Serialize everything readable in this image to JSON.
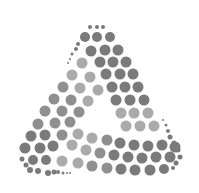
{
  "logo": {
    "shape": "triangle-of-dots",
    "colors": {
      "dark": "#7a7a7a",
      "mid": "#8f8f8f",
      "light": "#aaaaaa"
    },
    "dots": [
      [
        90,
        27,
        2,
        "d"
      ],
      [
        97,
        27,
        2,
        "d"
      ],
      [
        103,
        27,
        2,
        "d"
      ],
      [
        85,
        37,
        5,
        "d"
      ],
      [
        97,
        37,
        5,
        "d"
      ],
      [
        110,
        37,
        5,
        "d"
      ],
      [
        78,
        44,
        2,
        "d"
      ],
      [
        76,
        49,
        2,
        "d"
      ],
      [
        72,
        54,
        1.5,
        "d"
      ],
      [
        70,
        59,
        1,
        "d"
      ],
      [
        68,
        63,
        1,
        "d"
      ],
      [
        91,
        51,
        5.5,
        "d"
      ],
      [
        105,
        50,
        5.5,
        "d"
      ],
      [
        118,
        50,
        5.5,
        "d"
      ],
      [
        82,
        63,
        5.5,
        "l"
      ],
      [
        100,
        62,
        5.5,
        "d"
      ],
      [
        113,
        62,
        5.5,
        "d"
      ],
      [
        126,
        62,
        5.5,
        "d"
      ],
      [
        72,
        75,
        5.5,
        "l"
      ],
      [
        90,
        77,
        5.5,
        "l"
      ],
      [
        106,
        74,
        5.5,
        "d"
      ],
      [
        120,
        74,
        5.5,
        "d"
      ],
      [
        133,
        74,
        5.5,
        "d"
      ],
      [
        63,
        87,
        5.5,
        "m"
      ],
      [
        80,
        88,
        5.5,
        "l"
      ],
      [
        98,
        90,
        5.5,
        "l"
      ],
      [
        112,
        87,
        5.5,
        "d"
      ],
      [
        125,
        87,
        5.5,
        "d"
      ],
      [
        138,
        87,
        5.5,
        "d"
      ],
      [
        54,
        99,
        5.5,
        "m"
      ],
      [
        71,
        100,
        5.5,
        "m"
      ],
      [
        88,
        101,
        5.5,
        "l"
      ],
      [
        116,
        100,
        5.5,
        "d"
      ],
      [
        130,
        100,
        5.5,
        "d"
      ],
      [
        144,
        100,
        5.5,
        "d"
      ],
      [
        45,
        111,
        5.5,
        "m"
      ],
      [
        62,
        111,
        5.5,
        "m"
      ],
      [
        79,
        112,
        5.5,
        "m"
      ],
      [
        121,
        113,
        5.5,
        "l"
      ],
      [
        134,
        113,
        5.5,
        "l"
      ],
      [
        148,
        113,
        5.5,
        "l"
      ],
      [
        38,
        124,
        5.5,
        "m"
      ],
      [
        55,
        123,
        5.5,
        "m"
      ],
      [
        70,
        122,
        5.5,
        "m"
      ],
      [
        126,
        126,
        5.5,
        "l"
      ],
      [
        140,
        126,
        5.5,
        "l"
      ],
      [
        154,
        126,
        5.5,
        "l"
      ],
      [
        31,
        136,
        5.5,
        "d"
      ],
      [
        45,
        135,
        5.5,
        "d"
      ],
      [
        62,
        135,
        5.5,
        "m"
      ],
      [
        78,
        134,
        5.5,
        "l"
      ],
      [
        92,
        138,
        5.5,
        "l"
      ],
      [
        107,
        140,
        5.5,
        "m"
      ],
      [
        120,
        143,
        5.5,
        "d"
      ],
      [
        134,
        145,
        5.5,
        "d"
      ],
      [
        148,
        146,
        5.5,
        "d"
      ],
      [
        162,
        145,
        5.5,
        "d"
      ],
      [
        175,
        147,
        5.5,
        "d"
      ],
      [
        25,
        148,
        5.5,
        "d"
      ],
      [
        40,
        148,
        5.5,
        "d"
      ],
      [
        53,
        146,
        5.5,
        "d"
      ],
      [
        72,
        145,
        5.5,
        "l"
      ],
      [
        86,
        150,
        5.5,
        "l"
      ],
      [
        100,
        153,
        5.5,
        "m"
      ],
      [
        114,
        155,
        5.5,
        "d"
      ],
      [
        128,
        157,
        5.5,
        "d"
      ],
      [
        142,
        158,
        5.5,
        "d"
      ],
      [
        156,
        157,
        5.5,
        "d"
      ],
      [
        170,
        157,
        5.5,
        "d"
      ],
      [
        33,
        160,
        5,
        "d"
      ],
      [
        46,
        160,
        5,
        "d"
      ],
      [
        62,
        161,
        5.5,
        "l"
      ],
      [
        78,
        163,
        5.5,
        "l"
      ],
      [
        92,
        166,
        5.5,
        "m"
      ],
      [
        107,
        168,
        5.5,
        "m"
      ],
      [
        121,
        169,
        5.5,
        "d"
      ],
      [
        135,
        170,
        5.5,
        "d"
      ],
      [
        150,
        170,
        5.5,
        "d"
      ],
      [
        164,
        169,
        5,
        "d"
      ],
      [
        22,
        159,
        2.5,
        "d"
      ],
      [
        26,
        165,
        2.5,
        "d"
      ],
      [
        30,
        170,
        3,
        "d"
      ],
      [
        38,
        171,
        3,
        "d"
      ],
      [
        48,
        173,
        3,
        "d"
      ],
      [
        54,
        172,
        2.5,
        "d"
      ],
      [
        58,
        172,
        2,
        "d"
      ],
      [
        63,
        173,
        1.5,
        "d"
      ],
      [
        67,
        173,
        1,
        "d"
      ],
      [
        70,
        173,
        1,
        "d"
      ],
      [
        163,
        120,
        1,
        "d"
      ],
      [
        166,
        125,
        1.5,
        "d"
      ],
      [
        168,
        131,
        2,
        "d"
      ],
      [
        170,
        137,
        2.5,
        "d"
      ],
      [
        174,
        143,
        2.5,
        "d"
      ],
      [
        178,
        150,
        2.5,
        "d"
      ],
      [
        180,
        157,
        2.5,
        "d"
      ],
      [
        176,
        163,
        2.5,
        "d"
      ],
      [
        173,
        168,
        2,
        "d"
      ]
    ]
  }
}
